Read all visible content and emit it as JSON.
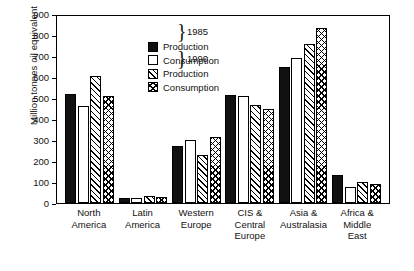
{
  "chart_data": {
    "type": "bar",
    "title": "",
    "xlabel": "",
    "ylabel": "Million tonnes oil equivalent",
    "ylim": [
      0,
      900
    ],
    "ytick_step": 100,
    "yticks": [
      900,
      800,
      700,
      600,
      500,
      400,
      300,
      200,
      100,
      0
    ],
    "grid": false,
    "legend_position": "top-left inside plot",
    "categories": [
      "North America",
      "Latin America",
      "Western Europe",
      "CIS & Central Europe",
      "Asia & Australasia",
      "Africa & Middle East"
    ],
    "category_lines": [
      [
        "North",
        "America"
      ],
      [
        "Latin",
        "America"
      ],
      [
        "Western",
        "Europe"
      ],
      [
        "CIS &",
        "Central",
        "Europe"
      ],
      [
        "Asia &",
        "Australasia"
      ],
      [
        "Africa &",
        "Middle",
        "East"
      ]
    ],
    "series": [
      {
        "name": "Production 1985",
        "key": "prod85",
        "swatch": "solid-black",
        "values": [
          520,
          25,
          270,
          515,
          650,
          135
        ]
      },
      {
        "name": "Consumption 1985",
        "key": "cons85",
        "swatch": "open-white",
        "values": [
          460,
          25,
          300,
          510,
          690,
          75
        ]
      },
      {
        "name": "Production 1990",
        "key": "prod90",
        "swatch": "diagonal-hatch",
        "values": [
          605,
          35,
          230,
          465,
          755,
          100
        ]
      },
      {
        "name": "Consumption 1990",
        "key": "cons90",
        "swatch": "cross-hatch",
        "values": [
          510,
          30,
          315,
          450,
          835,
          90
        ]
      }
    ]
  },
  "legend": {
    "rows": [
      {
        "label": "Production",
        "swatch": "solid-black"
      },
      {
        "label": "Consumption",
        "swatch": "open-white"
      },
      {
        "label": "Production",
        "swatch": "diagonal-hatch"
      },
      {
        "label": "Consumption",
        "swatch": "cross-hatch"
      }
    ],
    "group_years": [
      "1985",
      "1990"
    ],
    "brace": "}"
  },
  "colors": {
    "axis": "#000000",
    "bar_outline": "#000000",
    "prod85_fill": "#111111",
    "cons85_fill": "#ffffff",
    "background": "#ffffff"
  }
}
